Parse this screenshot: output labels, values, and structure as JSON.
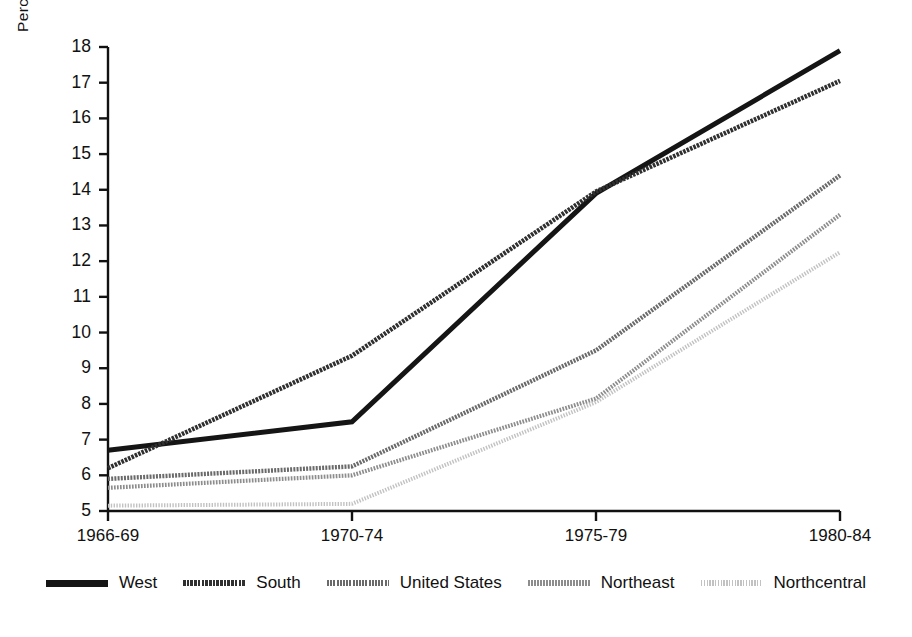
{
  "chart_data": {
    "type": "line",
    "title": "",
    "xlabel": "",
    "ylabel": "Percentage of difference",
    "categories": [
      "1966-69",
      "1970-74",
      "1975-79",
      "1980-84"
    ],
    "ylim": [
      5,
      18
    ],
    "yticks": [
      5,
      6,
      7,
      8,
      9,
      10,
      11,
      12,
      13,
      14,
      15,
      16,
      17,
      18
    ],
    "ytick_labels": [
      "5",
      "6",
      "7",
      "8",
      "9",
      "10",
      "11",
      "12",
      "13",
      "14",
      "15",
      "16",
      "17",
      "18"
    ],
    "grid": false,
    "legend_position": "bottom",
    "series": [
      {
        "name": "West",
        "values": [
          6.7,
          7.5,
          13.9,
          17.9
        ],
        "color": "#151515",
        "width": 5.0,
        "dash": "none"
      },
      {
        "name": "South",
        "values": [
          6.2,
          9.35,
          13.95,
          17.05
        ],
        "color": "#303030",
        "width": 4.6,
        "dash": "2.6 1.1"
      },
      {
        "name": "United States",
        "values": [
          5.9,
          6.25,
          9.5,
          14.4
        ],
        "color": "#6a6a6a",
        "width": 4.4,
        "dash": "2.0 1.2"
      },
      {
        "name": "Northeast",
        "values": [
          5.65,
          6.0,
          8.15,
          13.3
        ],
        "color": "#8d8d8d",
        "width": 4.2,
        "dash": "1.7 1.3"
      },
      {
        "name": "Northcentral",
        "values": [
          5.15,
          5.2,
          8.05,
          12.25
        ],
        "color": "#c2c2c2",
        "width": 4.0,
        "dash": "1.4 1.4"
      }
    ]
  },
  "axes": {
    "y_label": "Percentage of difference",
    "y_tick_labels": [
      "18",
      "17",
      "16",
      "15",
      "14",
      "13",
      "12",
      "11",
      "10",
      "9",
      "8",
      "7",
      "6",
      "5"
    ],
    "x_tick_labels": [
      "1966-69",
      "1970-74",
      "1975-79",
      "1980-84"
    ]
  },
  "legend": {
    "items": [
      {
        "label": "West"
      },
      {
        "label": "South"
      },
      {
        "label": "United States"
      },
      {
        "label": "Northeast"
      },
      {
        "label": "Northcentral"
      }
    ]
  }
}
